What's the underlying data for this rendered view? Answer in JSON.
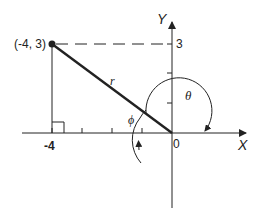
{
  "diagram": {
    "type": "coordinate-plane-polar-angle",
    "axes": {
      "x_label": "X",
      "y_label": "Y",
      "origin_label": "0"
    },
    "point": {
      "label": "(-4, 3)",
      "x": -4,
      "y": 3
    },
    "tick_labels": {
      "x_neg4": "-4",
      "y_3": "3"
    },
    "segment_label": "r",
    "angles": {
      "theta": "θ",
      "phi": "ϕ"
    },
    "colors": {
      "ink": "#222222",
      "background": "#ffffff"
    }
  }
}
